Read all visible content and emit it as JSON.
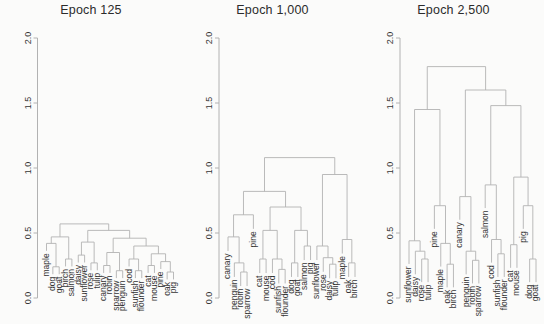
{
  "figure": {
    "background": "#fbfbfa",
    "line_color": "#b2b2b2",
    "text_color": "#343434",
    "title_color": "#2b2b2b"
  },
  "chart_data": [
    {
      "type": "dendrogram",
      "title": "Epoch 125",
      "ylim": [
        0,
        2
      ],
      "yticks": [
        "0.0",
        "0.5",
        "1.0",
        "1.5",
        "2.0"
      ],
      "grid": false,
      "leaf_label_rotation": 90,
      "leaf_order": [
        "maple",
        "dog",
        "goat",
        "birch",
        "salmon",
        "daisy",
        "sunflower",
        "rose",
        "tulip",
        "canary",
        "robin",
        "sparrow",
        "penguin",
        "cod",
        "sunfish",
        "flounder",
        "cat",
        "mouse",
        "pine",
        "oak",
        "pig"
      ],
      "tree": {
        "h": 0.57,
        "c": [
          {
            "h": 0.47,
            "c": [
              {
                "h": 0.42,
                "c": [
                  {
                    "leaf": "maple"
                  },
                  {
                    "h": 0.24,
                    "c": [
                      {
                        "leaf": "dog"
                      },
                      {
                        "leaf": "goat"
                      }
                    ]
                  }
                ]
              },
              {
                "h": 0.3,
                "c": [
                  {
                    "leaf": "birch"
                  },
                  {
                    "leaf": "salmon"
                  }
                ]
              }
            ]
          },
          {
            "h": 0.52,
            "c": [
              {
                "h": 0.43,
                "c": [
                  {
                    "h": 0.33,
                    "c": [
                      {
                        "leaf": "daisy"
                      },
                      {
                        "leaf": "sunflower"
                      }
                    ]
                  },
                  {
                    "h": 0.27,
                    "c": [
                      {
                        "leaf": "rose"
                      },
                      {
                        "leaf": "tulip"
                      }
                    ]
                  }
                ]
              },
              {
                "h": 0.46,
                "c": [
                  {
                    "h": 0.35,
                    "c": [
                      {
                        "h": 0.25,
                        "c": [
                          {
                            "leaf": "canary"
                          },
                          {
                            "leaf": "robin"
                          }
                        ]
                      },
                      {
                        "h": 0.21,
                        "c": [
                          {
                            "leaf": "sparrow"
                          },
                          {
                            "leaf": "penguin"
                          }
                        ]
                      }
                    ]
                  },
                  {
                    "h": 0.4,
                    "c": [
                      {
                        "h": 0.3,
                        "c": [
                          {
                            "leaf": "cod"
                          },
                          {
                            "h": 0.21,
                            "c": [
                              {
                                "leaf": "sunfish"
                              },
                              {
                                "leaf": "flounder"
                              }
                            ]
                          }
                        ]
                      },
                      {
                        "h": 0.34,
                        "c": [
                          {
                            "h": 0.25,
                            "c": [
                              {
                                "leaf": "cat"
                              },
                              {
                                "leaf": "mouse"
                              }
                            ]
                          },
                          {
                            "h": 0.28,
                            "c": [
                              {
                                "leaf": "pine"
                              },
                              {
                                "h": 0.2,
                                "c": [
                                  {
                                    "leaf": "oak"
                                  },
                                  {
                                    "leaf": "pig"
                                  }
                                ]
                              }
                            ]
                          }
                        ]
                      }
                    ]
                  }
                ]
              }
            ]
          }
        ]
      }
    },
    {
      "type": "dendrogram",
      "title": "Epoch 1,000",
      "ylim": [
        0,
        2
      ],
      "yticks": [
        "0.0",
        "0.5",
        "1.0",
        "1.5",
        "2.0"
      ],
      "grid": false,
      "leaf_label_rotation": 90,
      "leaf_order": [
        "canary",
        "penguin",
        "robin",
        "sparrow",
        "pine",
        "cat",
        "mouse",
        "cod",
        "sunfish",
        "flounder",
        "dog",
        "goat",
        "salmon",
        "pig",
        "sunflower",
        "rose",
        "daisy",
        "tulip",
        "maple",
        "oak",
        "birch"
      ],
      "tree": {
        "h": 1.08,
        "c": [
          {
            "h": 0.82,
            "c": [
              {
                "h": 0.64,
                "c": [
                  {
                    "h": 0.47,
                    "c": [
                      {
                        "leaf": "canary"
                      },
                      {
                        "h": 0.27,
                        "c": [
                          {
                            "leaf": "penguin"
                          },
                          {
                            "h": 0.2,
                            "c": [
                              {
                                "leaf": "robin"
                              },
                              {
                                "leaf": "sparrow"
                              }
                            ]
                          }
                        ]
                      }
                    ]
                  },
                  {
                    "leaf": "pine"
                  }
                ]
              },
              {
                "h": 0.7,
                "c": [
                  {
                    "h": 0.52,
                    "c": [
                      {
                        "h": 0.3,
                        "c": [
                          {
                            "leaf": "cat"
                          },
                          {
                            "leaf": "mouse"
                          }
                        ]
                      },
                      {
                        "h": 0.3,
                        "c": [
                          {
                            "leaf": "cod"
                          },
                          {
                            "h": 0.22,
                            "c": [
                              {
                                "leaf": "sunfish"
                              },
                              {
                                "leaf": "flounder"
                              }
                            ]
                          }
                        ]
                      }
                    ]
                  },
                  {
                    "h": 0.52,
                    "c": [
                      {
                        "h": 0.27,
                        "c": [
                          {
                            "leaf": "dog"
                          },
                          {
                            "leaf": "goat"
                          }
                        ]
                      },
                      {
                        "h": 0.4,
                        "c": [
                          {
                            "leaf": "salmon"
                          },
                          {
                            "leaf": "pig"
                          }
                        ]
                      }
                    ]
                  }
                ]
              }
            ]
          },
          {
            "h": 0.95,
            "c": [
              {
                "h": 0.4,
                "c": [
                  {
                    "leaf": "sunflower"
                  },
                  {
                    "h": 0.31,
                    "c": [
                      {
                        "leaf": "rose"
                      },
                      {
                        "h": 0.26,
                        "c": [
                          {
                            "leaf": "daisy"
                          },
                          {
                            "leaf": "tulip"
                          }
                        ]
                      }
                    ]
                  }
                ]
              },
              {
                "h": 0.45,
                "c": [
                  {
                    "leaf": "maple"
                  },
                  {
                    "h": 0.27,
                    "c": [
                      {
                        "leaf": "oak"
                      },
                      {
                        "leaf": "birch"
                      }
                    ]
                  }
                ]
              }
            ]
          }
        ]
      }
    },
    {
      "type": "dendrogram",
      "title": "Epoch 2,500",
      "ylim": [
        0,
        2
      ],
      "yticks": [
        "0.0",
        "0.5",
        "1.0",
        "1.5",
        "2.0"
      ],
      "grid": false,
      "leaf_label_rotation": 90,
      "leaf_order": [
        "sunflower",
        "daisy",
        "rose",
        "tulip",
        "pine",
        "maple",
        "oak",
        "birch",
        "canary",
        "penguin",
        "robin",
        "sparrow",
        "salmon",
        "cod",
        "sunfish",
        "flounder",
        "cat",
        "mouse",
        "pig",
        "dog",
        "goat"
      ],
      "tree": {
        "h": 1.78,
        "c": [
          {
            "h": 1.45,
            "c": [
              {
                "h": 0.44,
                "c": [
                  {
                    "leaf": "sunflower"
                  },
                  {
                    "h": 0.36,
                    "c": [
                      {
                        "leaf": "daisy"
                      },
                      {
                        "h": 0.3,
                        "c": [
                          {
                            "leaf": "rose"
                          },
                          {
                            "leaf": "tulip"
                          }
                        ]
                      }
                    ]
                  }
                ]
              },
              {
                "h": 0.71,
                "c": [
                  {
                    "leaf": "pine"
                  },
                  {
                    "h": 0.42,
                    "c": [
                      {
                        "leaf": "maple"
                      },
                      {
                        "h": 0.26,
                        "c": [
                          {
                            "leaf": "oak"
                          },
                          {
                            "leaf": "birch"
                          }
                        ]
                      }
                    ]
                  }
                ]
              }
            ]
          },
          {
            "h": 1.6,
            "c": [
              {
                "h": 0.78,
                "c": [
                  {
                    "leaf": "canary"
                  },
                  {
                    "h": 0.36,
                    "c": [
                      {
                        "leaf": "penguin"
                      },
                      {
                        "h": 0.29,
                        "c": [
                          {
                            "leaf": "robin"
                          },
                          {
                            "leaf": "sparrow"
                          }
                        ]
                      }
                    ]
                  }
                ]
              },
              {
                "h": 1.48,
                "c": [
                  {
                    "h": 0.87,
                    "c": [
                      {
                        "leaf": "salmon"
                      },
                      {
                        "h": 0.45,
                        "c": [
                          {
                            "leaf": "cod"
                          },
                          {
                            "h": 0.34,
                            "c": [
                              {
                                "leaf": "sunfish"
                              },
                              {
                                "leaf": "flounder"
                              }
                            ]
                          }
                        ]
                      }
                    ]
                  },
                  {
                    "h": 0.93,
                    "c": [
                      {
                        "h": 0.41,
                        "c": [
                          {
                            "leaf": "cat"
                          },
                          {
                            "leaf": "mouse"
                          }
                        ]
                      },
                      {
                        "h": 0.71,
                        "c": [
                          {
                            "leaf": "pig"
                          },
                          {
                            "h": 0.3,
                            "c": [
                              {
                                "leaf": "dog"
                              },
                              {
                                "leaf": "goat"
                              }
                            ]
                          }
                        ]
                      }
                    ]
                  }
                ]
              }
            ]
          }
        ]
      }
    }
  ]
}
